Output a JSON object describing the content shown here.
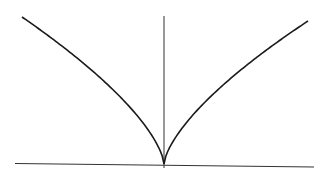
{
  "chart_data": {
    "type": "line",
    "title": "",
    "xlabel": "",
    "ylabel": "",
    "grid": false,
    "legend": "none",
    "xlim": [
      -1,
      1
    ],
    "ylim": [
      0,
      1
    ],
    "series": [
      {
        "name": "left-branch",
        "function": "|x|^(2/3)",
        "x_range": [
          -1,
          0
        ]
      },
      {
        "name": "right-branch",
        "function": "|x|^(2/3)",
        "x_range": [
          0,
          1
        ]
      }
    ],
    "colors": {
      "curve": "#1a1a1a",
      "axis": "#333333",
      "background": "#ffffff"
    }
  }
}
